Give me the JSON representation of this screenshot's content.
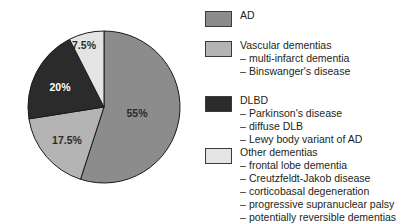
{
  "chart_data": {
    "type": "pie",
    "title": "",
    "xlabel": "",
    "ylabel": "",
    "categories": [
      "AD",
      "Vascular dementias",
      "DLBD",
      "Other dementias"
    ],
    "values": [
      55,
      17.5,
      20,
      7.5
    ],
    "data_labels": [
      "55%",
      "17.5%",
      "20%",
      "7.5%"
    ],
    "colors": [
      "#8c8c8c",
      "#b4b4b4",
      "#2b2b2b",
      "#e4e4e4"
    ],
    "label_colors": [
      "#2b2b2b",
      "#2b2b2b",
      "#ffffff",
      "#2b2b2b"
    ],
    "legend_position": "right",
    "grid": false,
    "start_angle_deg": 0,
    "direction": "clockwise"
  },
  "pie": {
    "center_x": 104,
    "center_y": 107,
    "radius": 76,
    "labels": [
      {
        "text": "55%",
        "x": 137,
        "y": 114,
        "fill": "#2b2b2b"
      },
      {
        "text": "17.5%",
        "x": 67,
        "y": 141,
        "fill": "#2b2b2b"
      },
      {
        "text": "20%",
        "x": 60,
        "y": 88,
        "fill": "#ffffff"
      },
      {
        "text": "7.5%",
        "x": 84,
        "y": 46,
        "fill": "#2b2b2b"
      }
    ]
  },
  "legend": {
    "groups": [
      {
        "key": "ad",
        "top": 11,
        "swatch_color": "#8c8c8c",
        "title": "AD",
        "items": []
      },
      {
        "key": "vascular-dementias",
        "top": 41,
        "swatch_color": "#b4b4b4",
        "title": "Vascular dementias",
        "items": [
          "multi-infarct dementia",
          "Binswanger's disease"
        ]
      },
      {
        "key": "dlbd",
        "top": 96,
        "swatch_color": "#2b2b2b",
        "title": "DLBD",
        "items": [
          "Parkinson's disease",
          "diffuse DLB",
          "Lewy body variant of AD"
        ]
      },
      {
        "key": "other-dementias",
        "top": 148,
        "swatch_color": "#e4e4e4",
        "title": "Other dementias",
        "items": [
          "frontal lobe dementia",
          "Creutzfeldt-Jakob disease",
          "corticobasal degeneration",
          "progressive supranuclear palsy",
          "potentially reversible dementias"
        ]
      }
    ],
    "dash": "–"
  }
}
